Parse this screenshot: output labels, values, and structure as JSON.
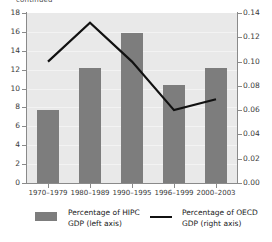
{
  "figure": {
    "clipped_title": "continued"
  },
  "chart_data": {
    "type": "bar",
    "title": "",
    "subtitle": "",
    "xlabel": "",
    "ylabel": "",
    "grid": true,
    "legend_position": "bottom",
    "categories": [
      "1970–1979",
      "1980–1989",
      "1990–1995",
      "1996–1999",
      "2000–2003"
    ],
    "series": [
      {
        "name": "Percentage of HIPC\nGDP (left axis)",
        "type": "bar",
        "axis": "left",
        "color": "#7d7d7d",
        "values": [
          7.7,
          12.2,
          15.9,
          10.4,
          12.2
        ]
      },
      {
        "name": "Percentage of OECD\nGDP (right axis)",
        "type": "line",
        "axis": "right",
        "color": "#111111",
        "values": [
          0.1,
          0.132,
          0.1,
          0.06,
          0.069
        ]
      }
    ],
    "left_axis": {
      "ylim": [
        0,
        18
      ],
      "ticks": [
        0,
        2,
        4,
        6,
        8,
        10,
        12,
        14,
        16,
        18
      ],
      "tick_labels": [
        "0",
        "2",
        "4",
        "6",
        "8",
        "10",
        "12",
        "14",
        "16",
        "18"
      ]
    },
    "right_axis": {
      "ylim": [
        0.0,
        0.14
      ],
      "ticks": [
        0.0,
        0.02,
        0.04,
        0.06,
        0.08,
        0.1,
        0.12,
        0.14
      ],
      "tick_labels": [
        "0.00",
        "0.02",
        "0.04",
        "0.06",
        "0.08",
        "0.10",
        "0.12",
        "0.14"
      ]
    }
  },
  "legend": {
    "items": [
      {
        "marker": "square-swatch",
        "label": "Percentage of HIPC\nGDP (left axis)"
      },
      {
        "marker": "line-swatch",
        "label": "Percentage of OECD\nGDP (right axis)"
      }
    ]
  }
}
